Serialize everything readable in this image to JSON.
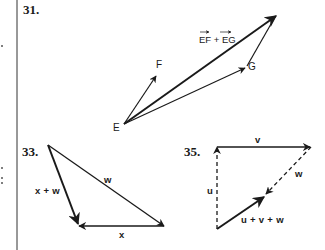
{
  "colors": {
    "ink": "#1a1a1a",
    "background": "#ffffff",
    "rule": "#333333"
  },
  "problems": [
    {
      "number": "31.",
      "points": {
        "E": "E",
        "F": "F",
        "G": "G"
      },
      "resultant_label": "EF + EG",
      "resultant_parts": [
        "EF",
        "+",
        "EG"
      ]
    },
    {
      "number": "33.",
      "vectors": {
        "w": "w",
        "x": "x",
        "sum": "x + w"
      }
    },
    {
      "number": "35.",
      "vectors": {
        "u": "u",
        "v": "v",
        "w": "w",
        "sum": "u + v + w"
      }
    }
  ],
  "margin": {
    "marks": [
      ".",
      ".",
      ";"
    ]
  }
}
